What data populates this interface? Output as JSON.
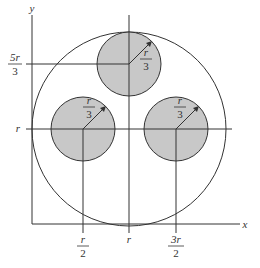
{
  "diagram": {
    "type": "geometry",
    "colors": {
      "stroke": "#333333",
      "fill": "#c8c8c8",
      "background": "#ffffff"
    },
    "axes": {
      "x_label": "x",
      "y_label": "y"
    },
    "y_ticks": [
      {
        "num": "5r",
        "den": "3"
      },
      {
        "label": "r"
      }
    ],
    "x_ticks": [
      {
        "num": "r",
        "den": "2"
      },
      {
        "label": "r"
      },
      {
        "num": "3r",
        "den": "2"
      }
    ],
    "big_circle": {
      "center": [
        "r",
        "r"
      ],
      "radius": "r"
    },
    "small_circles": [
      {
        "name": "top",
        "center": [
          "r",
          "5r/3"
        ],
        "radius_num": "r",
        "radius_den": "3"
      },
      {
        "name": "left",
        "center": [
          "r/2",
          "r"
        ],
        "radius_num": "r",
        "radius_den": "3"
      },
      {
        "name": "right",
        "center": [
          "3r/2",
          "r"
        ],
        "radius_num": "r",
        "radius_den": "3"
      }
    ]
  }
}
